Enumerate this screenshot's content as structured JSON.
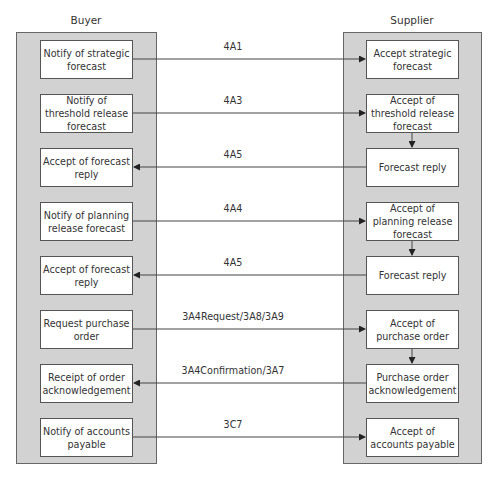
{
  "buyer": {
    "title": "Buyer",
    "steps": [
      "Notify of strategic forecast",
      "Notify of threshold release forecast",
      "Accept  of forecast reply",
      "Notify of planning release forecast",
      "Accept  of forecast reply",
      "Request purchase order",
      "Receipt of order acknowledgement",
      "Notify of accounts payable"
    ]
  },
  "supplier": {
    "title": "Supplier",
    "steps": [
      "Accept strategic forecast",
      "Accept of threshold release forecast",
      "Forecast reply",
      "Accept of planning release forecast",
      "Forecast reply",
      "Accept of purchase order",
      "Purchase order acknowledgement",
      "Accept of accounts payable"
    ]
  },
  "messages": [
    {
      "label": "4A1",
      "direction": "buyer-to-supplier"
    },
    {
      "label": "4A3",
      "direction": "buyer-to-supplier"
    },
    {
      "label": "4A5",
      "direction": "supplier-to-buyer"
    },
    {
      "label": "4A4",
      "direction": "buyer-to-supplier"
    },
    {
      "label": "4A5",
      "direction": "supplier-to-buyer"
    },
    {
      "label": "3A4Request/3A8/3A9",
      "direction": "buyer-to-supplier"
    },
    {
      "label": "3A4Confirmation/3A7",
      "direction": "supplier-to-buyer"
    },
    {
      "label": "3C7",
      "direction": "buyer-to-supplier"
    }
  ],
  "supplier_internal_links": [
    [
      1,
      2
    ],
    [
      3,
      4
    ],
    [
      5,
      6
    ]
  ],
  "colors": {
    "panel": "#d2d2d2",
    "line": "#333333",
    "box_border": "#555555"
  }
}
